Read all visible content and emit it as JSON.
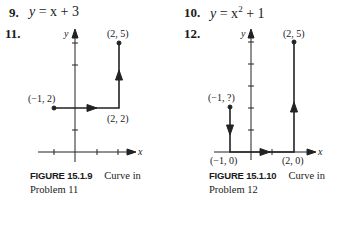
{
  "problems": [
    {
      "number": "9.",
      "equation_lhs": "y",
      "equation_rhs": "= x + 3"
    },
    {
      "number": "10.",
      "equation_lhs": "y",
      "equation_rhs_base": "= x",
      "equation_rhs_exp": "2",
      "equation_rhs_tail": "+ 1"
    },
    {
      "number": "11."
    },
    {
      "number": "12."
    }
  ],
  "figures": [
    {
      "id": "15.1.9",
      "caption_label": "FIGURE 15.1.9",
      "caption_text": "Curve in",
      "caption_text2": "Problem 11",
      "axis_x": "x",
      "axis_y": "y",
      "points": [
        {
          "label": "(−1, 2)",
          "x": -1,
          "y": 2
        },
        {
          "label": "(2, 2)",
          "x": 2,
          "y": 2
        },
        {
          "label": "(2, 5)",
          "x": 2,
          "y": 5
        }
      ]
    },
    {
      "id": "15.1.10",
      "caption_label": "FIGURE 15.1.10",
      "caption_text": "Curve in",
      "caption_text2": "Problem 12",
      "axis_x": "x",
      "axis_y": "y",
      "points": [
        {
          "label": "(−1, ?)",
          "x": -1,
          "y": 2
        },
        {
          "label": "(−1, 0)",
          "x": -1,
          "y": 0
        },
        {
          "label": "(2, 0)",
          "x": 2,
          "y": 0
        },
        {
          "label": "(2, 5)",
          "x": 2,
          "y": 5
        }
      ]
    }
  ]
}
